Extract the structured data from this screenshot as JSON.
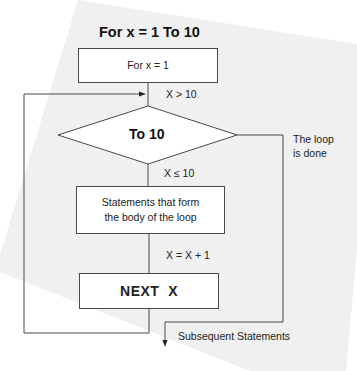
{
  "diagram": {
    "title": "For x = 1 To 10",
    "nodes": {
      "init": "For x = 1",
      "decision": "To 10",
      "body_line1": "Statements that form",
      "body_line2": "the body of the loop",
      "next": "NEXT  X"
    },
    "edge_labels": {
      "exit_condition": "X > 10",
      "continue_condition": "X ≤ 10",
      "increment": "X = X + 1",
      "done_line1": "The loop",
      "done_line2": "is done",
      "after": "Subsequent Statements"
    },
    "colors": {
      "background_sheet": "#f0f0f0",
      "line": "#4a4a4a",
      "text": "#222222"
    }
  }
}
